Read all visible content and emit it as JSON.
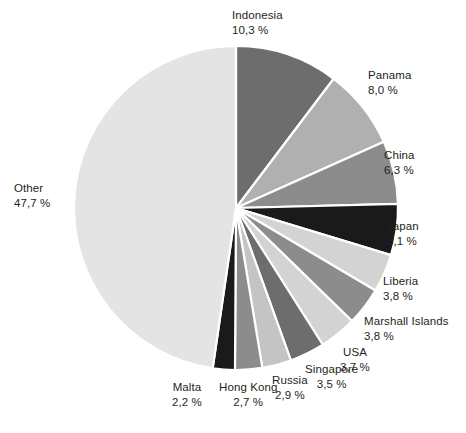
{
  "chart_data": {
    "type": "pie",
    "title": "",
    "subtitle": "",
    "xlabel": "",
    "ylabel": "",
    "legend_position": "none",
    "grid": false,
    "value_suffix": " %",
    "decimal_separator": ",",
    "start_angle_deg": 0,
    "direction": "clockwise",
    "categories": [
      "Indonesia",
      "Panama",
      "China",
      "Japan",
      "Liberia",
      "Marshall Islands",
      "USA",
      "Singapore",
      "Russia",
      "Hong Kong",
      "Malta",
      "Other"
    ],
    "values": [
      10.3,
      8.0,
      6.3,
      5.1,
      3.8,
      3.8,
      3.7,
      3.5,
      2.9,
      2.7,
      2.2,
      47.7
    ],
    "colors": [
      "#6d6d6d",
      "#b0b0b0",
      "#8c8c8c",
      "#1a1a1a",
      "#d3d3d3",
      "#8c8c8c",
      "#d3d3d3",
      "#6d6d6d",
      "#c4c4c4",
      "#8c8c8c",
      "#1a1a1a",
      "#e4e4e4"
    ],
    "slices": [
      {
        "label": "Indonesia",
        "value_text": "10,3 %",
        "value": 10.3,
        "color": "#6d6d6d"
      },
      {
        "label": "Panama",
        "value_text": "8,0 %",
        "value": 8.0,
        "color": "#b0b0b0"
      },
      {
        "label": "China",
        "value_text": "6,3 %",
        "value": 6.3,
        "color": "#8c8c8c"
      },
      {
        "label": "Japan",
        "value_text": "5,1 %",
        "value": 5.1,
        "color": "#1a1a1a"
      },
      {
        "label": "Liberia",
        "value_text": "3,8 %",
        "value": 3.8,
        "color": "#d3d3d3"
      },
      {
        "label": "Marshall Islands",
        "value_text": "3,8 %",
        "value": 3.8,
        "color": "#8c8c8c"
      },
      {
        "label": "USA",
        "value_text": "3,7 %",
        "value": 3.7,
        "color": "#d3d3d3"
      },
      {
        "label": "Singapore",
        "value_text": "3,5 %",
        "value": 3.5,
        "color": "#6d6d6d"
      },
      {
        "label": "Russia",
        "value_text": "2,9 %",
        "value": 2.9,
        "color": "#c4c4c4"
      },
      {
        "label": "Hong Kong",
        "value_text": "2,7 %",
        "value": 2.7,
        "color": "#8c8c8c"
      },
      {
        "label": "Malta",
        "value_text": "2,2 %",
        "value": 2.2,
        "color": "#1a1a1a"
      },
      {
        "label": "Other",
        "value_text": "47,7 %",
        "value": 47.7,
        "color": "#e4e4e4"
      }
    ],
    "geometry": {
      "center_x": 236,
      "center_y": 208,
      "radius": 162,
      "slice_gap_color": "#ffffff",
      "slice_gap_width": 2.2
    },
    "label_positions": [
      {
        "key": "Indonesia",
        "x": 232,
        "y": 8,
        "align": "lbl-right"
      },
      {
        "key": "Panama",
        "x": 368,
        "y": 68,
        "align": "lbl-right"
      },
      {
        "key": "China",
        "x": 384,
        "y": 148,
        "align": "lbl-right"
      },
      {
        "key": "Japan",
        "x": 387,
        "y": 219,
        "align": "lbl-right"
      },
      {
        "key": "Liberia",
        "x": 383,
        "y": 274,
        "align": "lbl-right"
      },
      {
        "key": "Marshall Islands",
        "x": 364,
        "y": 314,
        "align": "lbl-right"
      },
      {
        "key": "USA",
        "x": 340,
        "y": 345,
        "align": "lbl-center"
      },
      {
        "key": "Singapore",
        "x": 305,
        "y": 362,
        "align": "lbl-center"
      },
      {
        "key": "Russia",
        "x": 272,
        "y": 373,
        "align": "lbl-center"
      },
      {
        "key": "Hong Kong",
        "x": 219,
        "y": 380,
        "align": "lbl-center"
      },
      {
        "key": "Malta",
        "x": 172,
        "y": 380,
        "align": "lbl-center"
      },
      {
        "key": "Other",
        "x": 14,
        "y": 181,
        "align": "lbl-left"
      }
    ]
  }
}
